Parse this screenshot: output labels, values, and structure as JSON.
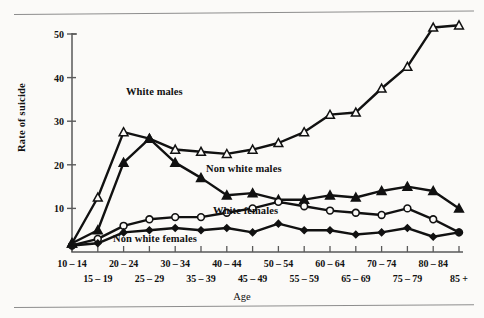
{
  "figure": {
    "has_top_rule": true,
    "has_bottom_rule": true,
    "background_color": "#fbfaf8",
    "ink_color": "#111111"
  },
  "axis": {
    "ylabel": "Rate of suicide",
    "xlabel": "Age",
    "yticks": [
      "10",
      "20",
      "30",
      "40",
      "50"
    ],
    "ylim_min": 0,
    "ylim_max": 54
  },
  "labels": {
    "white_males": "White males",
    "non_white_males": "Non white males",
    "white_females": "White females",
    "non_white_females": "Non white females"
  },
  "chart_data": {
    "type": "line",
    "title": "",
    "xlabel": "Age",
    "ylabel": "Rate of suicide",
    "ylim": [
      0,
      54
    ],
    "grid": false,
    "legend": "inline-annotations",
    "categories": [
      "10-14",
      "15-19",
      "20-24",
      "25-29",
      "30-34",
      "35-39",
      "40-44",
      "45-49",
      "50-54",
      "55-59",
      "60-64",
      "65-69",
      "70-74",
      "75-79",
      "80-84",
      "85+"
    ],
    "yticks": [
      10,
      20,
      30,
      40,
      50
    ],
    "series": [
      {
        "name": "White males",
        "marker": "open-triangle",
        "values": [
          2.0,
          12.5,
          27.5,
          26.0,
          23.5,
          23.0,
          22.5,
          23.5,
          25.0,
          27.5,
          31.5,
          32.0,
          37.5,
          42.5,
          51.5,
          52.0
        ]
      },
      {
        "name": "Non white males",
        "marker": "filled-triangle",
        "values": [
          2.0,
          5.0,
          20.5,
          26.0,
          20.5,
          17.0,
          13.0,
          13.5,
          12.0,
          12.0,
          13.0,
          12.5,
          14.0,
          15.0,
          14.0,
          10.0
        ]
      },
      {
        "name": "White females",
        "marker": "open-circle",
        "values": [
          1.5,
          3.0,
          6.0,
          7.5,
          8.0,
          8.0,
          9.0,
          10.0,
          11.5,
          10.5,
          9.5,
          9.0,
          8.5,
          10.0,
          7.5,
          4.5
        ]
      },
      {
        "name": "Non white females",
        "marker": "filled-diamond",
        "values": [
          1.5,
          2.0,
          4.5,
          5.0,
          5.5,
          5.0,
          5.5,
          4.5,
          6.5,
          5.0,
          5.0,
          4.0,
          4.5,
          5.5,
          3.5,
          4.5
        ]
      }
    ]
  }
}
